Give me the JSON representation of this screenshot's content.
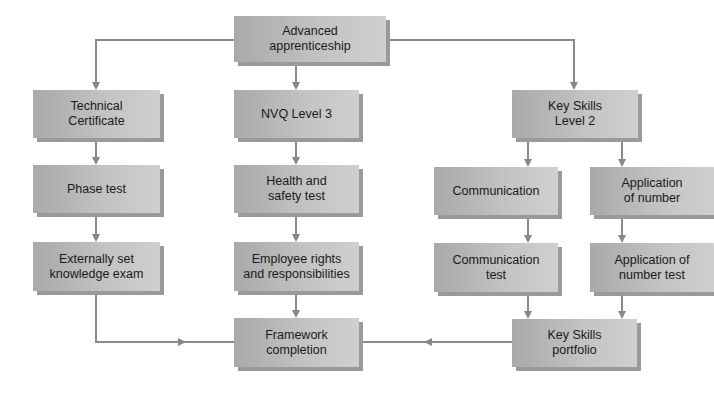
{
  "diagram": {
    "type": "flowchart",
    "colors": {
      "box_fill": "#c0c0c0",
      "box_shadow": "#9a9a9a",
      "line": "#888888",
      "text": "#1a1a1a"
    },
    "nodes": {
      "advanced": "Advanced\napprenticeship",
      "tech_cert": "Technical\nCertificate",
      "phase_test": "Phase test",
      "ext_exam": "Externally set\nknowledge exam",
      "nvq3": "NVQ Level 3",
      "health": "Health and\nsafety test",
      "employee": "Employee rights\nand responsibilities",
      "framework": "Framework\ncompletion",
      "keyskills2": "Key Skills\nLevel 2",
      "communication": "Communication",
      "app_number": "Application\nof number",
      "comm_test": "Communication\ntest",
      "app_test": "Application of\nnumber test",
      "portfolio": "Key Skills\nportfolio"
    },
    "edges": [
      [
        "advanced",
        "tech_cert"
      ],
      [
        "advanced",
        "nvq3"
      ],
      [
        "advanced",
        "keyskills2"
      ],
      [
        "tech_cert",
        "phase_test"
      ],
      [
        "phase_test",
        "ext_exam"
      ],
      [
        "ext_exam",
        "framework"
      ],
      [
        "nvq3",
        "health"
      ],
      [
        "health",
        "employee"
      ],
      [
        "employee",
        "framework"
      ],
      [
        "keyskills2",
        "communication"
      ],
      [
        "keyskills2",
        "app_number"
      ],
      [
        "communication",
        "comm_test"
      ],
      [
        "app_number",
        "app_test"
      ],
      [
        "comm_test",
        "portfolio"
      ],
      [
        "app_test",
        "portfolio"
      ],
      [
        "portfolio",
        "framework"
      ]
    ]
  }
}
